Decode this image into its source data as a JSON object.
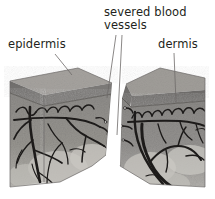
{
  "figure": {
    "type": "anatomical-illustration",
    "background_color": "#ffffff"
  },
  "labels": {
    "epidermis": "epidermis",
    "severed_blood_vessels_line1": "severed blood",
    "severed_blood_vessels_line2": "vessels",
    "dermis": "dermis"
  },
  "colors": {
    "text": "#231f20",
    "leader_line": "#6d6a68",
    "epidermis_top": "#a9a6a2",
    "epidermis_band": "#6f6d6b",
    "dermis_fill": "#8f8d8a",
    "hypodermis": "#c9c7c3",
    "vessel": "#1d1b1a",
    "block_edge": "#585654"
  },
  "regions": [
    {
      "name": "left-skin-block",
      "label": "epidermis"
    },
    {
      "name": "right-skin-block",
      "label": "dermis"
    },
    {
      "name": "wound-gap",
      "label": "severed blood vessels"
    }
  ]
}
